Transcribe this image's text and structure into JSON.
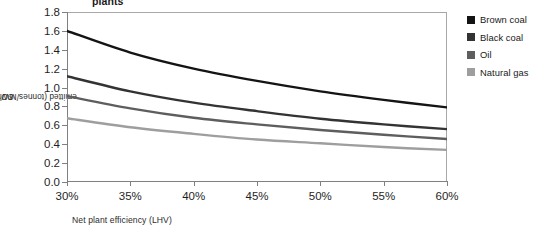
{
  "chart_data": {
    "type": "line",
    "title": "plants",
    "xlabel": "Net plant efficiency (LHV)",
    "ylabel": "CO2 emitted (tonnes/MWh net generation)",
    "ylabel_prefix": "CO",
    "ylabel_sub": "2",
    "ylabel_suffix": " emitted (tonnes/MWh net generation)",
    "x": [
      30,
      35,
      40,
      45,
      50,
      55,
      60
    ],
    "xtick_labels": [
      "30%",
      "35%",
      "40%",
      "45%",
      "50%",
      "55%",
      "60%"
    ],
    "ytick_labels": [
      "0.0",
      "0.2",
      "0.4",
      "0.6",
      "0.8",
      "1.0",
      "1.2",
      "1.4",
      "1.6",
      "1.8"
    ],
    "ytick_values": [
      0.0,
      0.2,
      0.4,
      0.6,
      0.8,
      1.0,
      1.2,
      1.4,
      1.6,
      1.8
    ],
    "xlim": [
      30,
      60
    ],
    "ylim": [
      0.0,
      1.8
    ],
    "grid": false,
    "legend_position": "right",
    "series": [
      {
        "name": "Brown coal",
        "color": "#141414",
        "values": [
          1.6,
          1.37,
          1.2,
          1.07,
          0.96,
          0.87,
          0.79
        ]
      },
      {
        "name": "Black coal",
        "color": "#333333",
        "values": [
          1.12,
          0.96,
          0.84,
          0.75,
          0.67,
          0.61,
          0.56
        ]
      },
      {
        "name": "Oil",
        "color": "#5e5e5e",
        "values": [
          0.91,
          0.78,
          0.68,
          0.61,
          0.55,
          0.5,
          0.455
        ]
      },
      {
        "name": "Natural gas",
        "color": "#9e9e9e",
        "values": [
          0.675,
          0.58,
          0.51,
          0.45,
          0.41,
          0.37,
          0.34
        ]
      }
    ]
  },
  "legend": {
    "items": [
      {
        "label": "Brown coal",
        "color": "#141414"
      },
      {
        "label": "Black coal",
        "color": "#333333"
      },
      {
        "label": "Oil",
        "color": "#5e5e5e"
      },
      {
        "label": "Natural gas",
        "color": "#9e9e9e"
      }
    ]
  }
}
